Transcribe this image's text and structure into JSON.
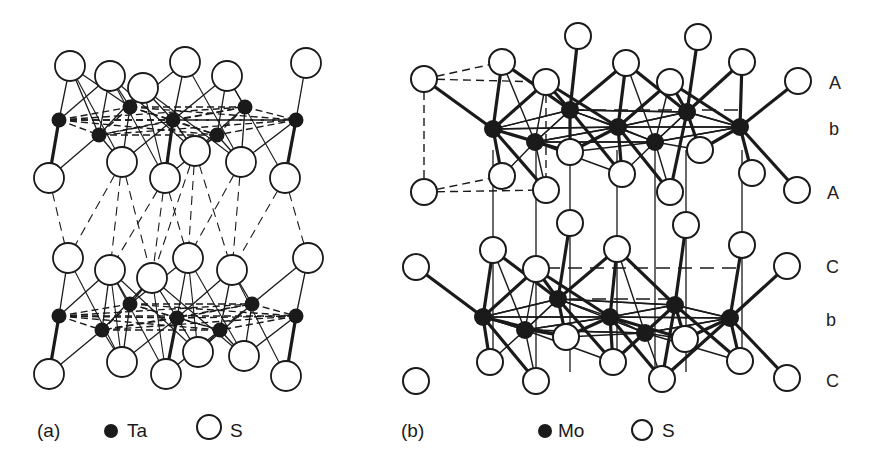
{
  "figure": {
    "background": "#ffffff",
    "ink_color": "#1a1a1a",
    "panels": [
      {
        "id": "a",
        "label": "(a)",
        "legend": [
          {
            "symbol": "filled-circle",
            "text": "Ta"
          },
          {
            "symbol": "open-circle",
            "text": "S"
          }
        ],
        "metal": "Ta",
        "chalcogen": "S",
        "layers": [
          {
            "metal_atoms": [
              [
                59,
                120
              ],
              [
                130,
                107
              ],
              [
                173,
                120
              ],
              [
                245,
                107
              ],
              [
                296,
                120
              ],
              [
                99,
                135
              ],
              [
                217,
                135
              ]
            ],
            "s_top": [
              [
                70,
                66
              ],
              [
                110,
                76
              ],
              [
                143,
                88
              ],
              [
                185,
                62
              ],
              [
                227,
                76
              ],
              [
                306,
                63
              ]
            ],
            "s_bottom": [
              [
                49,
                178
              ],
              [
                122,
                162
              ],
              [
                165,
                178
              ],
              [
                195,
                151
              ],
              [
                241,
                162
              ],
              [
                285,
                178
              ]
            ]
          },
          {
            "metal_atoms": [
              [
                59,
                316
              ],
              [
                130,
                304
              ],
              [
                177,
                318
              ],
              [
                252,
                304
              ],
              [
                296,
                316
              ],
              [
                102,
                330
              ],
              [
                220,
                330
              ]
            ],
            "s_top": [
              [
                68,
                258
              ],
              [
                110,
                270
              ],
              [
                152,
                278
              ],
              [
                188,
                258
              ],
              [
                232,
                270
              ],
              [
                308,
                258
              ]
            ],
            "s_bottom": [
              [
                49,
                374
              ],
              [
                122,
                362
              ],
              [
                166,
                374
              ],
              [
                198,
                352
              ],
              [
                244,
                356
              ],
              [
                286,
                376
              ]
            ]
          }
        ]
      },
      {
        "id": "b",
        "label": "(b)",
        "legend": [
          {
            "symbol": "filled-circle",
            "text": "Mo"
          },
          {
            "symbol": "open-circle",
            "text": "S"
          }
        ],
        "metal": "Mo",
        "chalcogen": "S",
        "stacking_labels": [
          {
            "text": "A",
            "y": 83
          },
          {
            "text": "b",
            "y": 130
          },
          {
            "text": "A",
            "y": 193
          },
          {
            "text": "C",
            "y": 267
          },
          {
            "text": "b",
            "y": 320
          },
          {
            "text": "C",
            "y": 381
          }
        ],
        "layers": [
          {
            "metal_atoms": [
              [
                493,
                129
              ],
              [
                570,
                110
              ],
              [
                618,
                127
              ],
              [
                687,
                112
              ],
              [
                740,
                127
              ],
              [
                535,
                142
              ],
              [
                655,
                142
              ]
            ],
            "s_top": [
              [
                424,
                79
              ],
              [
                502,
                62
              ],
              [
                546,
                82
              ],
              [
                578,
                36
              ],
              [
                626,
                63
              ],
              [
                670,
                82
              ],
              [
                698,
                37
              ],
              [
                742,
                62
              ],
              [
                798,
                81
              ]
            ],
            "s_bottom": [
              [
                424,
                192
              ],
              [
                502,
                176
              ],
              [
                546,
                190
              ],
              [
                570,
                152
              ],
              [
                622,
                174
              ],
              [
                670,
                192
              ],
              [
                700,
                150
              ],
              [
                752,
                173
              ],
              [
                797,
                190
              ]
            ]
          },
          {
            "metal_atoms": [
              [
                483,
                317
              ],
              [
                558,
                299
              ],
              [
                610,
                317
              ],
              [
                675,
                305
              ],
              [
                730,
                318
              ],
              [
                525,
                330
              ],
              [
                645,
                333
              ]
            ],
            "s_top": [
              [
                416,
                267
              ],
              [
                493,
                250
              ],
              [
                536,
                269
              ],
              [
                570,
                223
              ],
              [
                617,
                249
              ],
              [
                686,
                225
              ],
              [
                742,
                245
              ],
              [
                787,
                266
              ]
            ],
            "s_bottom": [
              [
                416,
                381
              ],
              [
                490,
                362
              ],
              [
                536,
                381
              ],
              [
                566,
                337
              ],
              [
                613,
                362
              ],
              [
                662,
                379
              ],
              [
                685,
                339
              ],
              [
                740,
                361
              ],
              [
                787,
                378
              ]
            ]
          }
        ]
      }
    ]
  }
}
